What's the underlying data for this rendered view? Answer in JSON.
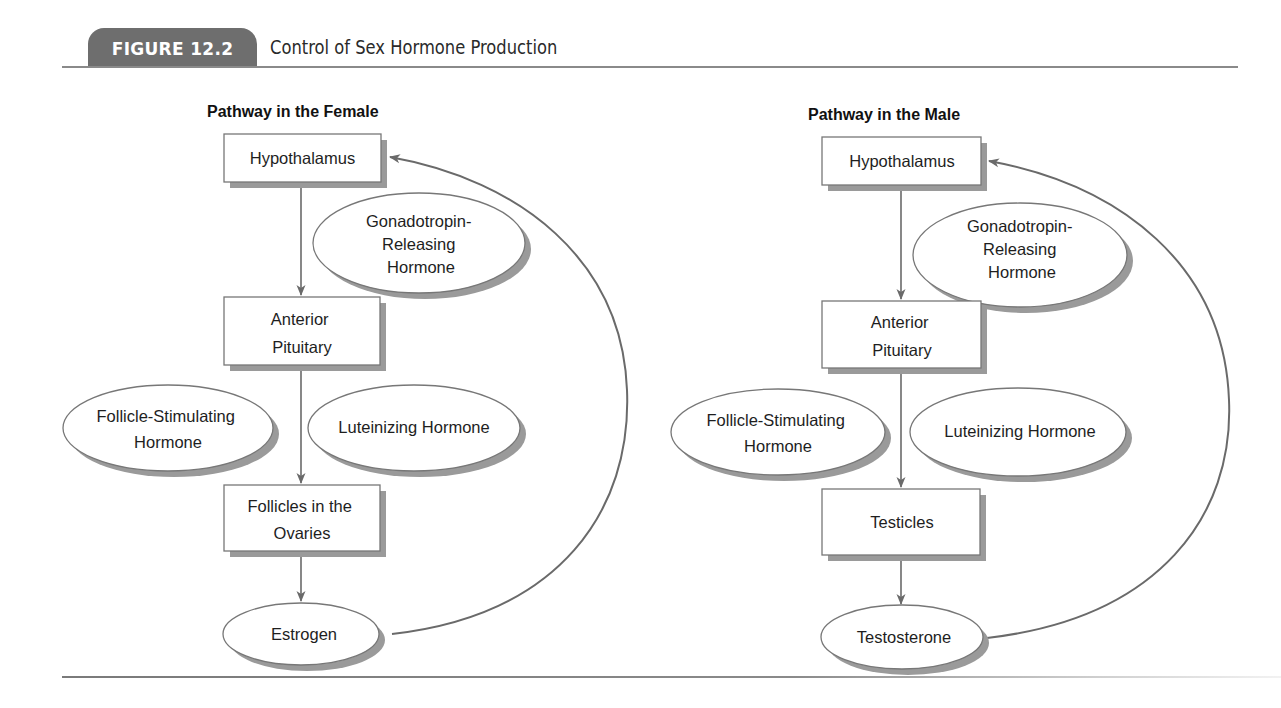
{
  "figure": {
    "label": "FIGURE 12.2",
    "title": "Control of Sex Hormone Production"
  },
  "colors": {
    "tab_background": "#6e6e6e",
    "tab_text": "#ffffff",
    "rule": "#8a8a8a",
    "node_border": "#777777",
    "node_shadow": "#9a9a9a",
    "arrow": "#6a6a6a",
    "text": "#1e1e1e"
  },
  "female": {
    "title": "Pathway in the Female",
    "hypothalamus": {
      "lines": [
        "Hypothalamus"
      ]
    },
    "gnrh": {
      "lines": [
        "Gonadotropin-",
        "Releasing",
        "Hormone"
      ]
    },
    "anterior_pituitary": {
      "lines": [
        "Anterior",
        "Pituitary"
      ]
    },
    "fsh": {
      "lines": [
        "Follicle-Stimulating",
        "Hormone"
      ]
    },
    "lh": {
      "lines": [
        "Luteinizing Hormone"
      ]
    },
    "gonad": {
      "lines": [
        "Follicles in the",
        "Ovaries"
      ]
    },
    "hormone": {
      "lines": [
        "Estrogen"
      ]
    }
  },
  "male": {
    "title": "Pathway in the Male",
    "hypothalamus": {
      "lines": [
        "Hypothalamus"
      ]
    },
    "gnrh": {
      "lines": [
        "Gonadotropin-",
        "Releasing",
        "Hormone"
      ]
    },
    "anterior_pituitary": {
      "lines": [
        "Anterior",
        "Pituitary"
      ]
    },
    "fsh": {
      "lines": [
        "Follicle-Stimulating",
        "Hormone"
      ]
    },
    "lh": {
      "lines": [
        "Luteinizing Hormone"
      ]
    },
    "gonad": {
      "lines": [
        "Testicles"
      ]
    },
    "hormone": {
      "lines": [
        "Testosterone"
      ]
    }
  },
  "edges": [
    {
      "from": "Hypothalamus",
      "to": "Anterior Pituitary",
      "via": "Gonadotropin-Releasing Hormone"
    },
    {
      "from": "Anterior Pituitary",
      "to": "Gonad",
      "via": "Follicle-Stimulating Hormone / Luteinizing Hormone"
    },
    {
      "from": "Gonad",
      "to": "Sex Hormone"
    },
    {
      "from": "Sex Hormone",
      "to": "Hypothalamus",
      "type": "feedback"
    }
  ]
}
